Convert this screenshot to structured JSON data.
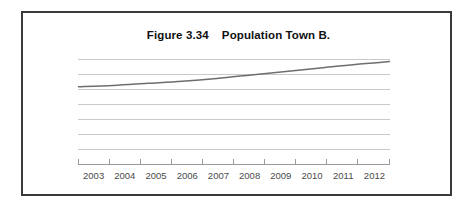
{
  "figure": {
    "title": "Figure 3.34    Population Town B.",
    "frame_color": "#3a3a3a",
    "background_color": "#ffffff"
  },
  "chart_data": {
    "type": "line",
    "title": "Figure 3.34    Population Town B.",
    "subtitle": "",
    "xlabel": "",
    "ylabel": "",
    "categories": [
      "2003",
      "2004",
      "2005",
      "2006",
      "2007",
      "2008",
      "2009",
      "2010",
      "2011",
      "2012"
    ],
    "x": [
      2003,
      2004,
      2005,
      2006,
      2007,
      2008,
      2009,
      2010,
      2011,
      2012
    ],
    "series": [
      {
        "name": "Population Town B",
        "color": "#6e6e6e",
        "values": [
          5.55,
          5.65,
          5.8,
          5.95,
          6.15,
          6.4,
          6.65,
          6.9,
          7.15,
          7.35
        ]
      }
    ],
    "ylim": [
      0,
      7.5
    ],
    "yticks": [
      0,
      1.07,
      2.14,
      3.21,
      4.29,
      5.36,
      6.43,
      7.5
    ],
    "ytick_labels": [
      "",
      "",
      "",
      "",
      "",
      "",
      "",
      ""
    ],
    "grid": true,
    "grid_color": "#c9c9c9",
    "grid_lines_count": 8,
    "axis_color": "#9a9a9a",
    "legend": false,
    "legend_position": "none",
    "annotations": []
  }
}
